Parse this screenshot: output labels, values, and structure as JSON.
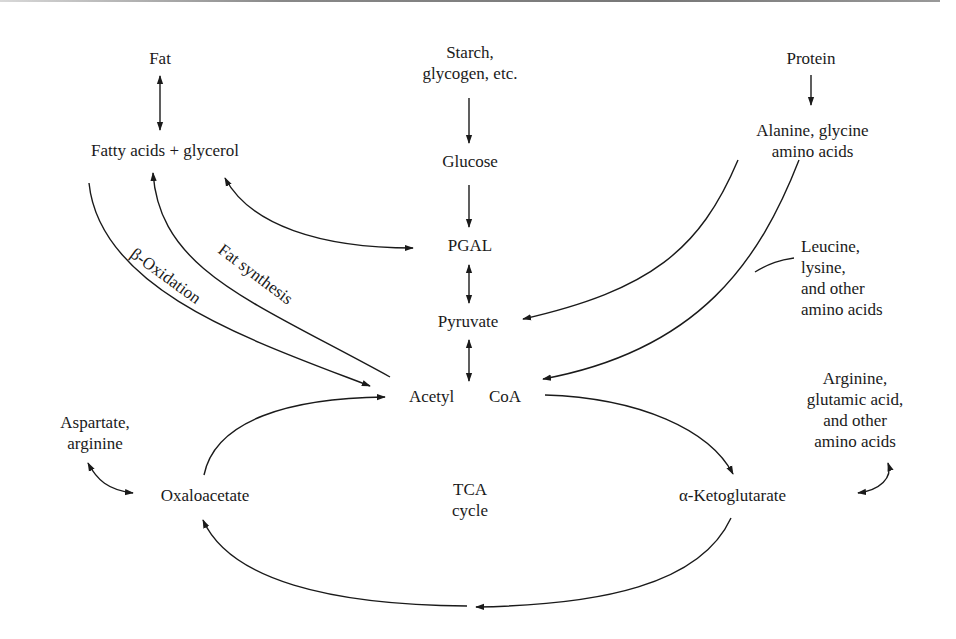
{
  "diagram": {
    "nodes": {
      "fat": "Fat",
      "fatty_acids": "Fatty acids + glycerol",
      "starch": "Starch,\nglycogen, etc.",
      "glucose": "Glucose",
      "pgal": "PGAL",
      "pyruvate": "Pyruvate",
      "acetyl": "Acetyl",
      "coa": "CoA",
      "protein": "Protein",
      "alanine": "Alanine, glycine\namino acids",
      "leucine": "Leucine,\nlysine,\nand other\namino acids",
      "arginine_glutamic": "Arginine,\nglutamic acid,\nand other\namino acids",
      "aspartate": "Aspartate,\narginine",
      "oxaloacetate": "Oxaloacetate",
      "tca": "TCA\ncycle",
      "ketoglutarate": "α-Ketoglutarate"
    },
    "edge_labels": {
      "beta_oxidation": "β-Oxidation",
      "fat_synthesis": "Fat synthesis"
    },
    "edges": [
      {
        "from": "Fat",
        "to": "Fatty acids + glycerol",
        "type": "bidirectional"
      },
      {
        "from": "Starch, glycogen, etc.",
        "to": "Glucose",
        "type": "directed"
      },
      {
        "from": "Glucose",
        "to": "PGAL",
        "type": "directed"
      },
      {
        "from": "PGAL",
        "to": "Pyruvate",
        "type": "bidirectional"
      },
      {
        "from": "Pyruvate",
        "to": "Acetyl CoA",
        "type": "bidirectional"
      },
      {
        "from": "Fatty acids + glycerol",
        "to": "PGAL",
        "type": "bidirectional"
      },
      {
        "from": "Fatty acids + glycerol",
        "to": "Acetyl CoA",
        "type": "directed",
        "label": "β-Oxidation"
      },
      {
        "from": "Acetyl CoA",
        "to": "Fatty acids + glycerol",
        "type": "directed",
        "label": "Fat synthesis"
      },
      {
        "from": "Protein",
        "to": "Alanine, glycine amino acids",
        "type": "directed"
      },
      {
        "from": "Alanine, glycine amino acids",
        "to": "Pyruvate",
        "type": "directed"
      },
      {
        "from": "Alanine, glycine amino acids",
        "to": "Acetyl CoA",
        "type": "directed"
      },
      {
        "from": "Leucine, lysine, and other amino acids",
        "to": "Acetyl CoA",
        "type": "directed"
      },
      {
        "from": "Acetyl CoA",
        "to": "α-Ketoglutarate",
        "type": "directed"
      },
      {
        "from": "α-Ketoglutarate",
        "to": "Oxaloacetate",
        "type": "directed"
      },
      {
        "from": "Oxaloacetate",
        "to": "Acetyl CoA",
        "type": "directed"
      },
      {
        "from": "Aspartate, arginine",
        "to": "Oxaloacetate",
        "type": "bidirectional"
      },
      {
        "from": "Arginine, glutamic acid, and other amino acids",
        "to": "α-Ketoglutarate",
        "type": "bidirectional"
      }
    ]
  }
}
